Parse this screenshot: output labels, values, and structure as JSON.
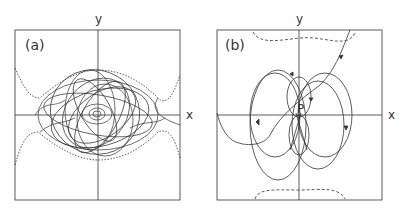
{
  "panels": [
    {
      "label": "(a)",
      "x_axis": "x",
      "y_axis": "y",
      "description": "chaotic trajectory bounded by dotted separatrix"
    },
    {
      "label": "(b)",
      "x_axis": "x",
      "y_axis": "y",
      "point_label": "P",
      "description": "trajectory loops around point P with dashed boundary curves"
    }
  ],
  "colors": {
    "line": "#333333",
    "background": "#ffffff"
  }
}
